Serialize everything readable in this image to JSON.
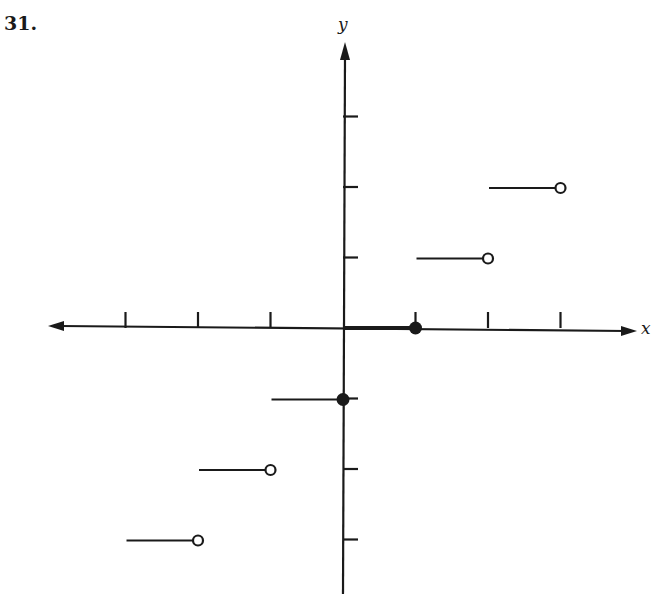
{
  "problem": {
    "number": "31."
  },
  "axes": {
    "x_label": "x",
    "y_label": "y"
  },
  "chart_data": {
    "type": "line",
    "title": "",
    "xlabel": "x",
    "ylabel": "y",
    "xlim": [
      -4,
      4
    ],
    "ylim": [
      -4,
      4
    ],
    "grid": false,
    "x_ticks": [
      -3,
      -2,
      -1,
      1,
      2,
      3
    ],
    "y_ticks": [
      -3,
      -2,
      -1,
      1,
      2,
      3
    ],
    "tick_labels_shown": false,
    "segments": [
      {
        "x_start": -3,
        "x_end": -2,
        "y": -3,
        "left_endpoint": "none",
        "right_endpoint": "open"
      },
      {
        "x_start": -2,
        "x_end": -1,
        "y": -2,
        "left_endpoint": "none",
        "right_endpoint": "open"
      },
      {
        "x_start": -1,
        "x_end": 0,
        "y": -1,
        "left_endpoint": "none",
        "right_endpoint": "closed"
      },
      {
        "x_start": 0,
        "x_end": 1,
        "y": 0,
        "left_endpoint": "none",
        "right_endpoint": "closed"
      },
      {
        "x_start": 1,
        "x_end": 2,
        "y": 1,
        "left_endpoint": "none",
        "right_endpoint": "open"
      },
      {
        "x_start": 2,
        "x_end": 3,
        "y": 2,
        "left_endpoint": "none",
        "right_endpoint": "open"
      }
    ]
  }
}
